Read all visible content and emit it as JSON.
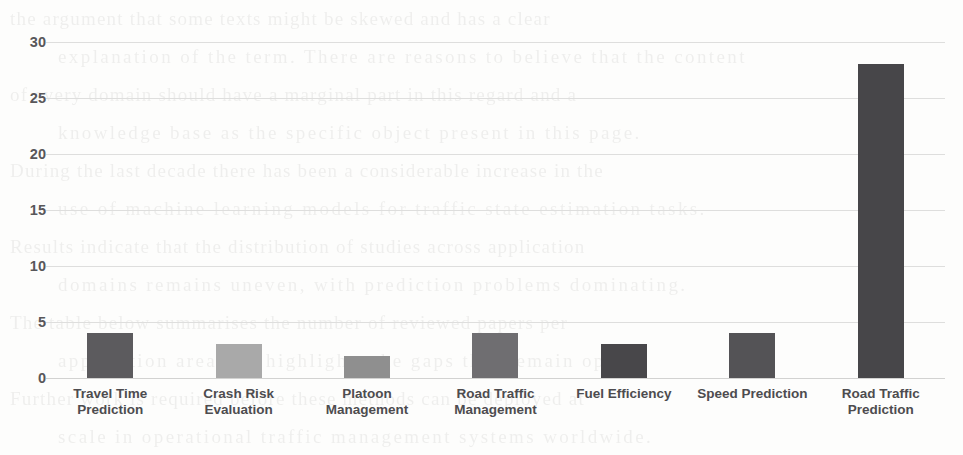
{
  "chart_data": {
    "type": "bar",
    "title": "",
    "subtitle": "",
    "xlabel": "",
    "ylabel": "",
    "ylim": [
      0,
      30
    ],
    "ytick_step": 5,
    "yticks": [
      "30",
      "25",
      "20",
      "15",
      "10",
      "5",
      "0"
    ],
    "grid": true,
    "legend": false,
    "legend_position": "none",
    "categories": [
      "Travel Time Prediction",
      "Crash Risk Evaluation",
      "Platoon Management",
      "Road Traffic Management",
      "Fuel Efficiency",
      "Speed Prediction",
      "Road Traffic Prediction"
    ],
    "category_lines": [
      [
        "Travel Time",
        "Prediction"
      ],
      [
        "Crash Risk",
        "Evaluation"
      ],
      [
        "Platoon",
        "Management"
      ],
      [
        "Road Traffic",
        "Management"
      ],
      [
        "Fuel Efficiency"
      ],
      [
        "Speed Prediction"
      ],
      [
        "Road Traffic",
        "Prediction"
      ]
    ],
    "values": [
      4,
      3,
      2,
      4,
      3,
      4,
      28
    ],
    "bar_colors": [
      "#5c5b5e",
      "#a9a9a9",
      "#8f8f8f",
      "#6f6e71",
      "#48474a",
      "#545356",
      "#474649"
    ]
  },
  "axis": {
    "grid_color": "#dededd",
    "tick_label_color": "#58575a"
  },
  "background": {
    "page_color": "#fdfdfc",
    "bleed_lines": [
      "the argument that some texts might be skewed and has a clear",
      "explanation of the term. There are reasons to believe that the content",
      "of every domain should have a marginal part in this regard and a",
      "knowledge base as the specific object present in this page.",
      "During the last decade there has been a considerable increase in the",
      "use of machine learning models for traffic state estimation tasks.",
      "Results indicate that the distribution of studies across application",
      "domains remains uneven, with prediction problems dominating.",
      "The table below summarises the number of reviewed papers per",
      "application area and highlights the gaps that remain open.",
      "Further work is required before these methods can be deployed at",
      "scale in operational traffic management systems worldwide."
    ]
  }
}
